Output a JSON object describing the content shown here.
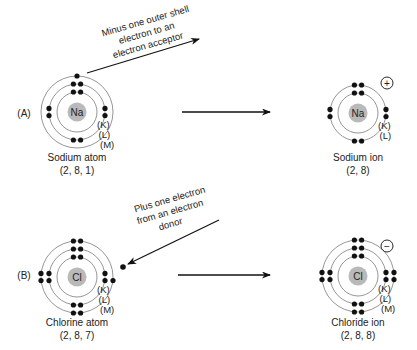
{
  "colors": {
    "ink": "#111111",
    "ring": "#8a8a8a",
    "nucleus": "#b9b9b9",
    "text": "#222222"
  },
  "rows": [
    {
      "label": "(A)",
      "transfer_note": [
        "Minus one outer shell",
        "electron to an",
        "electron acceptor"
      ],
      "transfer_direction": "out",
      "atom": {
        "symbol": "Na",
        "name": "Sodium atom",
        "config": "(2, 8, 1)",
        "shell_labels": [
          "(K)",
          "(L)",
          "(M)"
        ],
        "shell_counts": [
          2,
          8,
          1
        ]
      },
      "ion": {
        "symbol": "Na",
        "name": "Sodium ion",
        "config": "(2, 8)",
        "shell_labels": [
          "(K)",
          "(L)"
        ],
        "shell_counts": [
          2,
          8
        ],
        "charge": "+"
      }
    },
    {
      "label": "(B)",
      "transfer_note": [
        "Plus one electron",
        "from an electron",
        "donor"
      ],
      "transfer_direction": "in",
      "atom": {
        "symbol": "Cl",
        "name": "Chlorine atom",
        "config": "(2, 8, 7)",
        "shell_labels": [
          "(K)",
          "(L)",
          "(M)"
        ],
        "shell_counts": [
          2,
          8,
          7
        ]
      },
      "ion": {
        "symbol": "Cl",
        "name": "Chloride ion",
        "config": "(2, 8, 8)",
        "shell_labels": [
          "(K)",
          "(L)",
          "(M)"
        ],
        "shell_counts": [
          2,
          8,
          8
        ],
        "charge": "−"
      }
    }
  ]
}
